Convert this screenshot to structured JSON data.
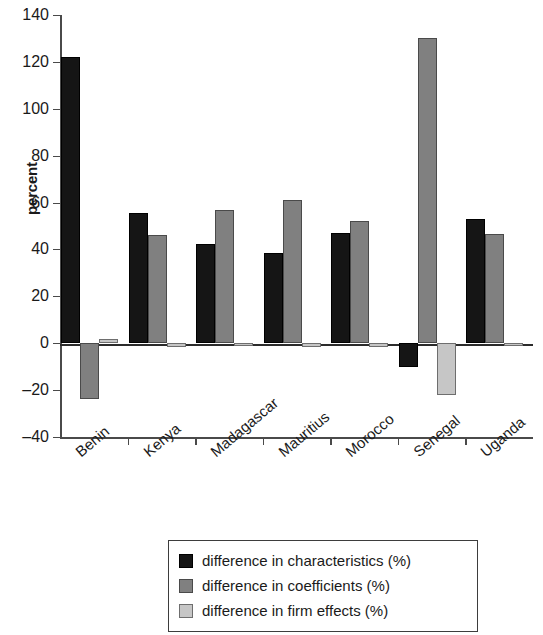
{
  "chart_data": {
    "type": "bar",
    "title": "",
    "xlabel": "",
    "ylabel": "percent",
    "ylim": [
      -40,
      140
    ],
    "yticks": [
      140,
      120,
      100,
      80,
      60,
      40,
      20,
      0,
      -20,
      -40
    ],
    "grid": false,
    "legend_position": "bottom",
    "categories": [
      "Benin",
      "Kenya",
      "Madagascar",
      "Mauritius",
      "Morocco",
      "Senegal",
      "Uganda"
    ],
    "series": [
      {
        "name": "difference in characteristics (%)",
        "color": "#151515",
        "values": [
          122,
          55.5,
          42.5,
          38.5,
          47,
          -10,
          53
        ]
      },
      {
        "name": "difference in coefficients (%)",
        "color": "#808080",
        "values": [
          -24,
          46,
          57,
          61,
          52,
          130,
          46.5
        ]
      },
      {
        "name": "difference in firm effects (%)",
        "color": "#c6c6c6",
        "values": [
          2,
          -1.5,
          -1,
          -1.5,
          -1.5,
          -22,
          -1
        ]
      }
    ]
  },
  "legend": {
    "items": [
      {
        "label": "difference in characteristics (%)"
      },
      {
        "label": "difference in coefficients (%)"
      },
      {
        "label": "difference in firm effects (%)"
      }
    ]
  }
}
